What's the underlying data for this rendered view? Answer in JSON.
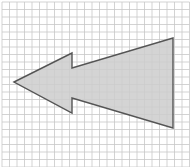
{
  "figure": {
    "type": "grid-shape-diagram",
    "grid": {
      "cell_size_px": 7.5,
      "origin_x": 2,
      "origin_y": 2,
      "columns": 25,
      "rows": 22,
      "line_color": "#c8c8c8",
      "background": "#ffffff"
    },
    "shape": {
      "name": "left-arrow",
      "fill": "#cccccc",
      "fill_opacity": 0.85,
      "stroke": "#555555",
      "stroke_width": 1.4,
      "points": [
        [
          14,
          82
        ],
        [
          72,
          53
        ],
        [
          72,
          68
        ],
        [
          173,
          38
        ],
        [
          173,
          128
        ],
        [
          72,
          98
        ],
        [
          72,
          113
        ]
      ]
    }
  }
}
